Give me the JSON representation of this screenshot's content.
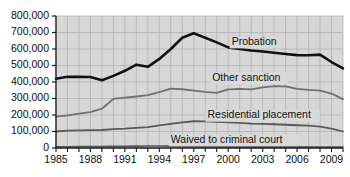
{
  "chart_data": {
    "type": "line",
    "title": "",
    "subtitle": "",
    "xlabel": "",
    "ylabel": "",
    "xlim": [
      1985,
      2010
    ],
    "ylim": [
      0,
      800000
    ],
    "grid": true,
    "legend_position": "inline-labels",
    "x": [
      1985,
      1986,
      1987,
      1988,
      1989,
      1990,
      1991,
      1992,
      1993,
      1994,
      1995,
      1996,
      1997,
      1998,
      1999,
      2000,
      2001,
      2002,
      2003,
      2004,
      2005,
      2006,
      2007,
      2008,
      2009,
      2010
    ],
    "y_ticks": [
      0,
      100000,
      200000,
      300000,
      400000,
      500000,
      600000,
      700000,
      800000
    ],
    "y_tick_labels": [
      "0",
      "100,000",
      "200,000",
      "300,000",
      "400,000",
      "500,000",
      "600,000",
      "700,000",
      "800,000"
    ],
    "x_ticks": [
      1985,
      1988,
      1991,
      1994,
      1997,
      2000,
      2003,
      2006,
      2009
    ],
    "x_tick_labels": [
      "1985",
      "1988",
      "1991",
      "1994",
      "1997",
      "2000",
      "2003",
      "2006",
      "2009"
    ],
    "series": [
      {
        "name": "Probation",
        "color": "#111111",
        "width": 2.6,
        "label_x": 2000.3,
        "label_y": 640000,
        "values": [
          420000,
          432000,
          431000,
          430000,
          411000,
          437000,
          468000,
          505000,
          492000,
          540000,
          600000,
          668000,
          695000,
          668000,
          640000,
          610000,
          600000,
          591000,
          585000,
          577000,
          570000,
          563000,
          562000,
          566000,
          521000,
          483000
        ]
      },
      {
        "name": "Other sanction",
        "color": "#707070",
        "width": 1.8,
        "label_x": 1998.6,
        "label_y": 423000,
        "values": [
          190000,
          198000,
          208000,
          218000,
          238000,
          298000,
          305000,
          312000,
          320000,
          338000,
          360000,
          356000,
          348000,
          340000,
          334000,
          355000,
          358000,
          355000,
          368000,
          375000,
          374000,
          358000,
          352000,
          348000,
          330000,
          296000
        ]
      },
      {
        "name": "Residential placement",
        "color": "#595959",
        "width": 1.8,
        "label_x": 1998.2,
        "label_y": 196000,
        "values": [
          100000,
          105000,
          107000,
          108000,
          109000,
          114000,
          117000,
          122000,
          127000,
          137000,
          146000,
          155000,
          162000,
          161000,
          158000,
          155000,
          152000,
          148000,
          146000,
          144000,
          141000,
          138000,
          135000,
          130000,
          118000,
          100000
        ]
      },
      {
        "name": "Waived to criminal court",
        "color": "#555555",
        "width": 1.6,
        "label_x": 1995.0,
        "label_y": 47000,
        "values": [
          7200,
          7800,
          8300,
          8700,
          9100,
          9800,
          10400,
          11500,
          12000,
          12200,
          11200,
          10200,
          9400,
          8600,
          8100,
          7500,
          7000,
          7100,
          7000,
          6900,
          6800,
          6600,
          6500,
          6400,
          6100,
          5400
        ]
      }
    ]
  },
  "axes": {
    "plot_bg": "#d7d7d7",
    "grid_color": "#b2b2b2",
    "axis_color": "#1a1a1a"
  }
}
